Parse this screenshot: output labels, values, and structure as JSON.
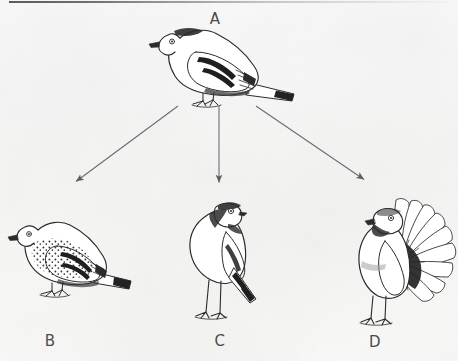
{
  "figure": {
    "caption": "Rock pigeon (A) and three derived domestic breeds (B, C, D)",
    "background_color": "#f8f8f7",
    "ink_color": "#2b2b2b",
    "label_color": "#4c4c50",
    "arrow_color": "#6a6a6e"
  },
  "labels": {
    "a": "A",
    "b": "B",
    "c": "C",
    "d": "D"
  },
  "nodes": [
    {
      "id": "A",
      "label": "A",
      "name": "rock-pigeon",
      "description": "Ancestral rock pigeon shown in side profile, perched, facing left, with dark wing bars and dark tail band",
      "label_position": {
        "x": 215,
        "y": 19
      },
      "illustration_center": {
        "x": 222,
        "y": 68
      },
      "illustration_size": {
        "width": 132,
        "height": 86
      }
    },
    {
      "id": "B",
      "label": "B",
      "name": "speckled-breed-pigeon",
      "description": "Domestic breed with heavily speckled breast and mantle, perched side profile facing left",
      "label_position": {
        "x": 50,
        "y": 343
      },
      "illustration_center": {
        "x": 68,
        "y": 257
      },
      "illustration_size": {
        "width": 124,
        "height": 100
      }
    },
    {
      "id": "C",
      "label": "C",
      "name": "pouter-pigeon",
      "description": "Pouter breed with inflated crop, upright posture, long legs, head turned back",
      "label_position": {
        "x": 220,
        "y": 343
      },
      "illustration_center": {
        "x": 222,
        "y": 258
      },
      "illustration_size": {
        "width": 84,
        "height": 128
      }
    },
    {
      "id": "D",
      "label": "D",
      "name": "fantail-pigeon",
      "description": "Fantail breed with broad erect fanned tail of many feathers, upright body, head turned back",
      "label_position": {
        "x": 375,
        "y": 344
      },
      "illustration_center": {
        "x": 390,
        "y": 255
      },
      "illustration_size": {
        "width": 124,
        "height": 132
      }
    }
  ],
  "arrows": [
    {
      "id": "arrow-a-to-b",
      "from": "A",
      "to": "B",
      "start": {
        "x": 178,
        "y": 106
      },
      "end": {
        "x": 74,
        "y": 183
      },
      "direction": "down-left"
    },
    {
      "id": "arrow-a-to-c",
      "from": "A",
      "to": "C",
      "start": {
        "x": 219,
        "y": 106
      },
      "end": {
        "x": 219,
        "y": 184
      },
      "direction": "down"
    },
    {
      "id": "arrow-a-to-d",
      "from": "A",
      "to": "D",
      "start": {
        "x": 256,
        "y": 106
      },
      "end": {
        "x": 366,
        "y": 181
      },
      "direction": "down-right"
    }
  ],
  "decorations": {
    "top_rule": {
      "name": "top-border-rule",
      "x": 9,
      "y": 1,
      "width": 440,
      "height": 2
    }
  }
}
